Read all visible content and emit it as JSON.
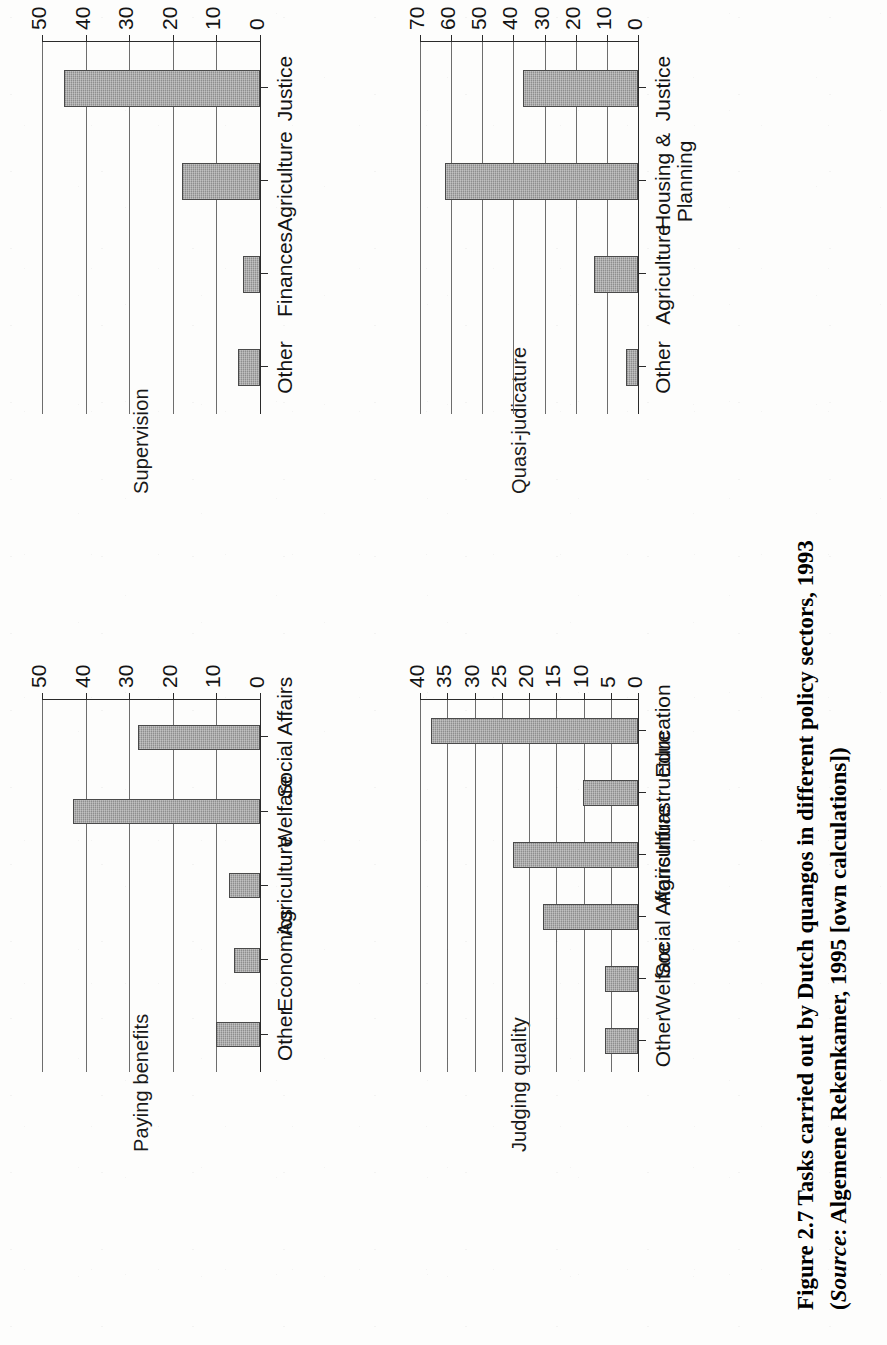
{
  "figure": {
    "caption_line1": "Figure 2.7  Tasks carried out by Dutch quangos in different policy sectors, 1993",
    "caption_line2_prefix": "(",
    "caption_line2_source_label": "Source",
    "caption_line2_rest": ": Algemene Rekenkamer, 1995 [own calculations])"
  },
  "chart_data": [
    {
      "id": "paying-benefits",
      "type": "bar",
      "title": "Paying benefits",
      "categories": [
        "Other",
        "Economics",
        "Agriculture",
        "Welfare",
        "Social Affairs"
      ],
      "values": [
        10,
        6,
        7,
        43,
        28
      ],
      "ticks": [
        0,
        10,
        20,
        30,
        40,
        50
      ],
      "ylim": [
        0,
        50
      ],
      "xlabel": "",
      "ylabel": "",
      "grid": true,
      "legend": "none",
      "orientation": "vertical"
    },
    {
      "id": "supervision",
      "type": "bar",
      "title": "Supervision",
      "categories": [
        "Other",
        "Finances",
        "Agriculture",
        "Justice"
      ],
      "values": [
        5,
        4,
        18,
        45
      ],
      "ticks": [
        0,
        10,
        20,
        30,
        40,
        50
      ],
      "ylim": [
        0,
        50
      ],
      "xlabel": "",
      "ylabel": "",
      "grid": true,
      "legend": "none",
      "orientation": "vertical"
    },
    {
      "id": "judging-quality",
      "type": "bar",
      "title": "Judging quality",
      "categories": [
        "Other",
        "Welfare",
        "Social Affairs",
        "Agriculture",
        "Infrastructure",
        "Education"
      ],
      "values": [
        6,
        6,
        17.5,
        23,
        10,
        38
      ],
      "ticks": [
        0,
        5,
        10,
        15,
        20,
        25,
        30,
        35,
        40
      ],
      "ylim": [
        0,
        40
      ],
      "xlabel": "",
      "ylabel": "",
      "grid": true,
      "legend": "none",
      "orientation": "vertical"
    },
    {
      "id": "quasi-judicature",
      "type": "bar",
      "title": "Quasi-judicature",
      "categories": [
        "Other",
        "Agriculture",
        "Housing &\nPlanning",
        "Justice"
      ],
      "values": [
        4,
        14,
        62,
        37
      ],
      "ticks": [
        0,
        10,
        20,
        30,
        40,
        50,
        60,
        70
      ],
      "ylim": [
        0,
        70
      ],
      "xlabel": "",
      "ylabel": "",
      "grid": true,
      "legend": "none",
      "orientation": "vertical"
    }
  ],
  "style": {
    "bar_fill": "#8e8e8e",
    "bar_stroke": "#4a4a4a",
    "grid_color": "#6d6d6d",
    "axis_color": "#2a2a2a",
    "page_background": "#fdfdfc",
    "text_color": "#141414"
  }
}
